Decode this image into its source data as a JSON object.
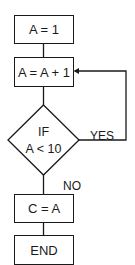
{
  "diagram": {
    "type": "flowchart",
    "nodes": [
      {
        "id": "init",
        "shape": "rectangle",
        "text": "A = 1"
      },
      {
        "id": "increment",
        "shape": "rectangle",
        "text": "A = A + 1"
      },
      {
        "id": "decision",
        "shape": "diamond",
        "line1": "IF",
        "line2": "A < 10"
      },
      {
        "id": "assign",
        "shape": "rectangle",
        "text": "C = A"
      },
      {
        "id": "end",
        "shape": "rectangle",
        "text": "END"
      }
    ],
    "edges": [
      {
        "from": "init",
        "to": "increment",
        "label": ""
      },
      {
        "from": "increment",
        "to": "decision",
        "label": ""
      },
      {
        "from": "decision",
        "to": "increment",
        "label": "YES"
      },
      {
        "from": "decision",
        "to": "assign",
        "label": "NO"
      },
      {
        "from": "assign",
        "to": "end",
        "label": ""
      }
    ],
    "labels": {
      "yes": "YES",
      "no": "NO"
    },
    "colors": {
      "stroke": "#1a1a1a",
      "fill": "#ffffff"
    }
  }
}
